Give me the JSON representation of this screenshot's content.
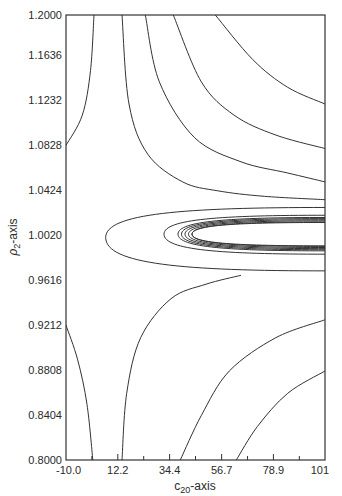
{
  "chart_data": {
    "type": "contour",
    "title": "",
    "xlabel": "c20-axis",
    "xlabel_main": "c",
    "xlabel_sub": "20",
    "xlabel_suffix": "-axis",
    "ylabel": "ρ2-axis",
    "ylabel_main": "ρ",
    "ylabel_sub": "2",
    "ylabel_suffix": "-axis",
    "xlim": [
      -10.0,
      101
    ],
    "ylim": [
      0.8,
      1.2
    ],
    "x_ticks": [
      "-10.0",
      "12.2",
      "34.4",
      "56.7",
      "78.9",
      "101"
    ],
    "x_tick_values": [
      -10.0,
      12.2,
      34.4,
      56.7,
      78.9,
      101
    ],
    "x_minor_tick_values": [
      1.1,
      23.3,
      45.5,
      67.8,
      90.0
    ],
    "y_ticks": [
      "1.2000",
      "1.1636",
      "1.1232",
      "1.0828",
      "1.0424",
      "1.0020",
      "0.9616",
      "0.9212",
      "0.8808",
      "0.8404",
      "0.8000"
    ],
    "y_tick_values": [
      1.2,
      1.1636,
      1.1232,
      1.0828,
      1.0424,
      1.002,
      0.9616,
      0.9212,
      0.8808,
      0.8404,
      0.8
    ],
    "grid": false,
    "hatched_region": {
      "description": "hatched elliptical region centered near rho2=1.002, extending to right edge",
      "x_range": [
        45,
        101
      ],
      "y_range": [
        0.985,
        1.017
      ]
    },
    "contours": [
      {
        "name": "upper-left",
        "points": [
          [
            -10.0,
            1.0828
          ],
          [
            -3,
            1.11
          ],
          [
            0.5,
            1.15
          ],
          [
            2,
            1.2
          ]
        ]
      },
      {
        "name": "upper-1",
        "points": [
          [
            14,
            1.2
          ],
          [
            17,
            1.12
          ],
          [
            25,
            1.075
          ],
          [
            40,
            1.05
          ],
          [
            55,
            1.042
          ],
          [
            75,
            1.037
          ],
          [
            101,
            1.034
          ]
        ]
      },
      {
        "name": "upper-2",
        "points": [
          [
            24,
            1.2
          ],
          [
            30,
            1.14
          ],
          [
            45,
            1.09
          ],
          [
            65,
            1.068
          ],
          [
            85,
            1.058
          ],
          [
            101,
            1.05
          ]
        ]
      },
      {
        "name": "upper-3",
        "points": [
          [
            36,
            1.2
          ],
          [
            48,
            1.14
          ],
          [
            62,
            1.11
          ],
          [
            80,
            1.092
          ],
          [
            101,
            1.08
          ]
        ]
      },
      {
        "name": "upper-4",
        "points": [
          [
            54,
            1.2
          ],
          [
            70,
            1.16
          ],
          [
            85,
            1.135
          ],
          [
            101,
            1.12
          ]
        ]
      },
      {
        "name": "lower-left",
        "points": [
          [
            -10.0,
            0.9212
          ],
          [
            -5,
            0.89
          ],
          [
            -1,
            0.85
          ],
          [
            1.5,
            0.8
          ]
        ]
      },
      {
        "name": "lower-1",
        "points": [
          [
            14,
            0.8
          ],
          [
            16,
            0.86
          ],
          [
            22,
            0.91
          ],
          [
            35,
            0.945
          ],
          [
            50,
            0.958
          ],
          [
            65,
            0.966
          ]
        ]
      },
      {
        "name": "lower-2",
        "points": [
          [
            39,
            0.8
          ],
          [
            48,
            0.84
          ],
          [
            60,
            0.88
          ],
          [
            80,
            0.91
          ],
          [
            101,
            0.926
          ]
        ]
      },
      {
        "name": "lower-3",
        "points": [
          [
            63,
            0.8
          ],
          [
            72,
            0.83
          ],
          [
            85,
            0.86
          ],
          [
            101,
            0.88
          ]
        ]
      },
      {
        "name": "loop-outer",
        "closed_at": "right-edge"
      },
      {
        "name": "loop-inner",
        "closed_at": "right-edge"
      }
    ]
  }
}
